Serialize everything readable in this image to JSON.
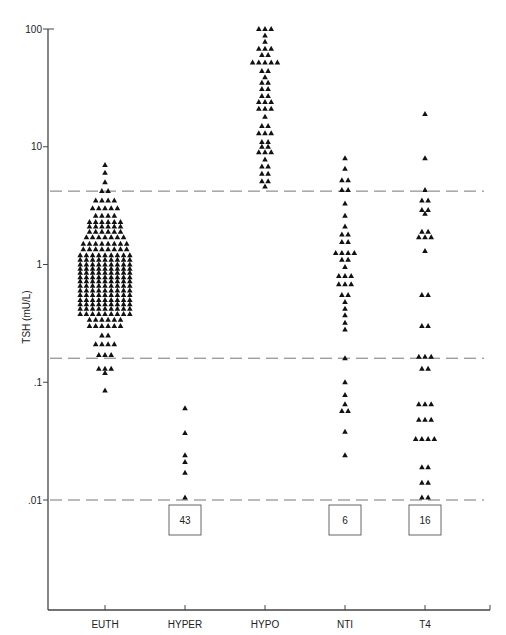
{
  "chart_data": {
    "type": "scatter",
    "subtype": "dot-strip (beeswarm) plot, log y-axis",
    "title": "",
    "xlabel": "",
    "ylabel": "TSH (mU/L)",
    "yscale": "log",
    "ylim": [
      0.001,
      100
    ],
    "yticks": [
      {
        "value": 100,
        "label": "100"
      },
      {
        "value": 10,
        "label": "10"
      },
      {
        "value": 1,
        "label": "1"
      },
      {
        "value": 0.1,
        "label": ".1"
      },
      {
        "value": 0.01,
        "label": ".01"
      }
    ],
    "categories": [
      "EUTH",
      "HYPER",
      "HYPO",
      "NTI",
      "T4"
    ],
    "reference_lines": [
      {
        "value": 4.2,
        "style": "dashed"
      },
      {
        "value": 0.16,
        "style": "dashed"
      },
      {
        "value": 0.01,
        "style": "dashed"
      }
    ],
    "marker": "filled-triangle",
    "below_detection_counts": [
      {
        "category": "HYPER",
        "count": "43"
      },
      {
        "category": "NTI",
        "count": "6"
      },
      {
        "category": "T4",
        "count": "16"
      }
    ],
    "series": [
      {
        "name": "EUTH",
        "rows": [
          [
            7.0,
            1
          ],
          [
            6.0,
            1
          ],
          [
            5.0,
            1
          ],
          [
            4.2,
            2
          ],
          [
            3.5,
            4
          ],
          [
            3.0,
            5
          ],
          [
            2.6,
            4
          ],
          [
            2.3,
            6
          ],
          [
            2.1,
            6
          ],
          [
            1.9,
            6
          ],
          [
            1.7,
            7
          ],
          [
            1.5,
            8
          ],
          [
            1.35,
            8
          ],
          [
            1.2,
            9
          ],
          [
            1.1,
            9
          ],
          [
            1.0,
            9
          ],
          [
            0.92,
            9
          ],
          [
            0.85,
            9
          ],
          [
            0.78,
            9
          ],
          [
            0.72,
            9
          ],
          [
            0.66,
            9
          ],
          [
            0.6,
            9
          ],
          [
            0.55,
            9
          ],
          [
            0.5,
            9
          ],
          [
            0.46,
            9
          ],
          [
            0.42,
            9
          ],
          [
            0.38,
            9
          ],
          [
            0.34,
            6
          ],
          [
            0.3,
            6
          ],
          [
            0.25,
            2
          ],
          [
            0.21,
            4
          ],
          [
            0.17,
            3
          ],
          [
            0.13,
            3
          ],
          [
            0.12,
            1
          ],
          [
            0.085,
            1
          ]
        ]
      },
      {
        "name": "HYPER",
        "rows": [
          [
            0.06,
            1
          ],
          [
            0.037,
            1
          ],
          [
            0.024,
            1
          ],
          [
            0.021,
            1
          ],
          [
            0.017,
            1
          ],
          [
            0.0105,
            1
          ]
        ]
      },
      {
        "name": "HYPO",
        "rows": [
          [
            100,
            3
          ],
          [
            88,
            1
          ],
          [
            78,
            1
          ],
          [
            68,
            3
          ],
          [
            60,
            2
          ],
          [
            52,
            5
          ],
          [
            44,
            2
          ],
          [
            39,
            1
          ],
          [
            35,
            2
          ],
          [
            31,
            2
          ],
          [
            27,
            2
          ],
          [
            24,
            3
          ],
          [
            21,
            3
          ],
          [
            18,
            1
          ],
          [
            15,
            2
          ],
          [
            13,
            3
          ],
          [
            11,
            2
          ],
          [
            10,
            2
          ],
          [
            9,
            3
          ],
          [
            7.8,
            1
          ],
          [
            6.8,
            2
          ],
          [
            5.9,
            2
          ],
          [
            5.1,
            2
          ],
          [
            4.6,
            1
          ]
        ]
      },
      {
        "name": "NTI",
        "rows": [
          [
            8.0,
            1
          ],
          [
            6.5,
            1
          ],
          [
            5.2,
            2
          ],
          [
            4.3,
            2
          ],
          [
            3.3,
            1
          ],
          [
            2.6,
            1
          ],
          [
            2.1,
            1
          ],
          [
            1.8,
            2
          ],
          [
            1.55,
            2
          ],
          [
            1.25,
            4
          ],
          [
            1.1,
            2
          ],
          [
            0.95,
            1
          ],
          [
            0.8,
            3
          ],
          [
            0.68,
            3
          ],
          [
            0.55,
            2
          ],
          [
            0.48,
            1
          ],
          [
            0.42,
            1
          ],
          [
            0.37,
            1
          ],
          [
            0.32,
            1
          ],
          [
            0.28,
            1
          ],
          [
            0.16,
            1
          ],
          [
            0.1,
            1
          ],
          [
            0.078,
            1
          ],
          [
            0.065,
            1
          ],
          [
            0.057,
            2
          ],
          [
            0.038,
            1
          ],
          [
            0.024,
            1
          ]
        ]
      },
      {
        "name": "T4",
        "rows": [
          [
            19,
            1
          ],
          [
            8.0,
            1
          ],
          [
            4.3,
            1
          ],
          [
            3.5,
            2
          ],
          [
            2.9,
            2
          ],
          [
            2.7,
            1
          ],
          [
            1.9,
            2
          ],
          [
            1.7,
            3
          ],
          [
            1.3,
            1
          ],
          [
            0.55,
            2
          ],
          [
            0.3,
            2
          ],
          [
            0.165,
            3
          ],
          [
            0.13,
            2
          ],
          [
            0.065,
            3
          ],
          [
            0.048,
            3
          ],
          [
            0.033,
            4
          ],
          [
            0.019,
            2
          ],
          [
            0.014,
            2
          ],
          [
            0.0105,
            2
          ]
        ]
      }
    ]
  },
  "axes": {
    "ylabel": "TSH (mU/L)",
    "ytick_labels": [
      "100",
      "10",
      "1",
      ".1",
      ".01"
    ],
    "xtick_labels": [
      "EUTH",
      "HYPER",
      "HYPO",
      "NTI",
      "T4"
    ]
  },
  "count_boxes": [
    {
      "category": "HYPER",
      "label": "43"
    },
    {
      "category": "NTI",
      "label": "6"
    },
    {
      "category": "T4",
      "label": "16"
    }
  ],
  "colors": {
    "axis": "#444444",
    "marker": "#111111",
    "dashed_line": "#777777",
    "box_border": "#666666"
  }
}
